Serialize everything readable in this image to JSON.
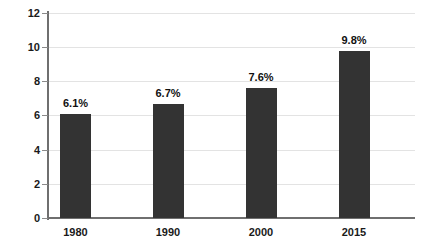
{
  "chart_data": {
    "type": "bar",
    "title": "",
    "subtitle": "",
    "xlabel": "",
    "ylabel": "",
    "categories": [
      "1980",
      "1990",
      "2000",
      "2015"
    ],
    "values": [
      6.1,
      6.7,
      7.6,
      9.8
    ],
    "data_labels": [
      "6.1%",
      "6.7%",
      "7.6%",
      "9.8%"
    ],
    "ylim": [
      0,
      12
    ],
    "y_ticks": [
      0,
      2,
      4,
      6,
      8,
      10,
      12
    ],
    "y_tick_labels": [
      "0",
      "2",
      "4",
      "6",
      "8",
      "10",
      "12"
    ],
    "grid": true,
    "legend": null,
    "legend_position": "none",
    "bar_color": "#333333",
    "gridline_color": "#e3e3e3",
    "axis_color": "#6f6f6f",
    "background_color": "#ffffff"
  },
  "axis": {
    "y_labels": [
      "12",
      "10",
      "8",
      "6",
      "4",
      "2",
      "0"
    ]
  },
  "bars": [
    {
      "label": "1980",
      "value_label": "6.1%",
      "value": 6.1
    },
    {
      "label": "1990",
      "value_label": "6.7%",
      "value": 6.7
    },
    {
      "label": "2000",
      "value_label": "7.6%",
      "value": 7.6
    },
    {
      "label": "2015",
      "value_label": "9.8%",
      "value": 9.8
    }
  ]
}
